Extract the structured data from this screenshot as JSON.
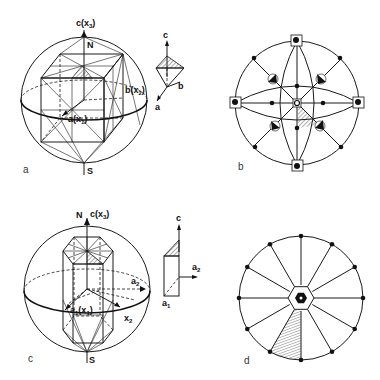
{
  "figure": {
    "panels": [
      {
        "id": "a",
        "caption": "a",
        "description": "Cubic crystal inscribed in sphere with axes",
        "labels": {
          "axis_c": "c(x",
          "axis_c_sub": "3",
          "axis_c_close": ")",
          "north": "N",
          "south": "S",
          "axis_b": "b(x",
          "axis_b_sub": "2",
          "axis_b_close": ")",
          "axis_a": "a(x",
          "axis_a_sub": "1",
          "axis_a_close": ")"
        },
        "inset": {
          "label_c": "c",
          "label_b": "b",
          "label_a": "a"
        }
      },
      {
        "id": "b",
        "caption": "b",
        "description": "Stereographic projection of cubic symmetry (m3m) with hatched asymmetric unit"
      },
      {
        "id": "c",
        "caption": "c",
        "description": "Hexagonal prism inscribed in sphere with axes",
        "labels": {
          "north": "N",
          "axis_c": "c(x",
          "axis_c_sub": "3",
          "axis_c_close": ")",
          "south": "S",
          "axis_a2": "a",
          "axis_a2_sub": "2",
          "axis_a1": "a",
          "axis_a1_sub": "1",
          "axis_a1_x": "(x",
          "axis_a1_x_sub": "1",
          "axis_a1_x_close": ")",
          "axis_x2": "x",
          "axis_x2_sub": "2"
        },
        "inset": {
          "label_c": "c",
          "label_a2": "a",
          "label_a2_sub": "2",
          "label_a1": "a",
          "label_a1_sub": "1"
        }
      },
      {
        "id": "d",
        "caption": "d",
        "description": "Stereographic projection of hexagonal symmetry (6/mmm) with 12 great-circle spokes and hatched asymmetric unit",
        "spoke_count": 12
      }
    ]
  },
  "colors": {
    "ink": "#111111",
    "background": "#ffffff",
    "hatch": "#333333"
  }
}
